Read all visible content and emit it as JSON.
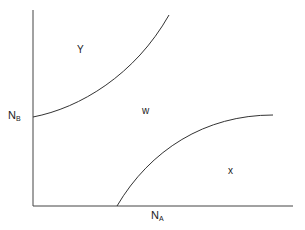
{
  "diagram": {
    "axes": {
      "y_label_main": "N",
      "y_label_sub": "B",
      "x_label_main": "N",
      "x_label_sub": "A"
    },
    "regions": [
      {
        "id": "y",
        "label": "Y"
      },
      {
        "id": "w",
        "label": "w"
      },
      {
        "id": "x",
        "label": "x"
      }
    ],
    "curves": [
      {
        "name": "upper-boundary",
        "from": [
          33,
          117
        ],
        "to": [
          169,
          15
        ]
      },
      {
        "name": "lower-boundary",
        "from": [
          117,
          206
        ],
        "to": [
          273,
          115
        ]
      }
    ],
    "colors": {
      "line": "#333333",
      "background": "#ffffff"
    }
  }
}
